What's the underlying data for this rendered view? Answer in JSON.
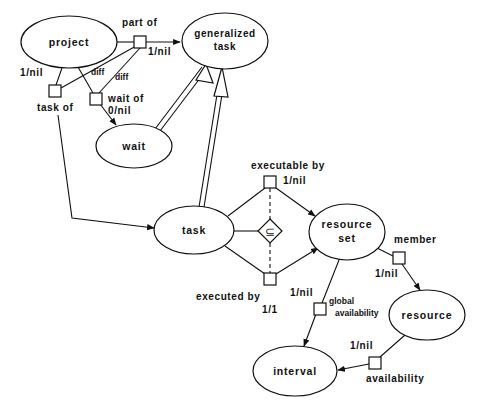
{
  "diagram": {
    "type": "entity-relationship diagram",
    "nodes": {
      "project": "project",
      "generalized_task_line1": "generalized",
      "generalized_task_line2": "task",
      "wait": "wait",
      "task": "task",
      "resource_set_line1": "resource",
      "resource_set_line2": "set",
      "resource": "resource",
      "interval": "interval"
    },
    "relations": {
      "part_of": "part of",
      "part_of_card": "1/nil",
      "task_of": "task of",
      "task_of_card": "1/nil",
      "wait_of": "wait of",
      "wait_of_card": "0/nil",
      "diff1": "diff",
      "diff2": "diff",
      "executable_by": "executable by",
      "executable_by_card": "1/nil",
      "executed_by": "executed by",
      "executed_by_card": "1/1",
      "executed_by_card2": "1/nil",
      "subset_symbol": "⊆",
      "member": "member",
      "member_card": "1/nil",
      "global_availability_line1": "global",
      "global_availability_line2": "availability",
      "availability": "availability",
      "availability_card": "1/nil"
    }
  }
}
